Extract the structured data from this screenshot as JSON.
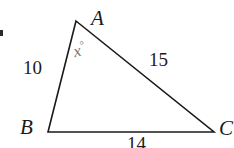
{
  "figure": {
    "background_color": "#ffffff",
    "stroke_color": "#1a1a1a",
    "width": 234,
    "height": 148
  },
  "vertices": {
    "a": {
      "label": "A",
      "x": 76,
      "y": 21
    },
    "b": {
      "label": "B",
      "x": 48,
      "y": 132
    },
    "c": {
      "label": "C",
      "x": 214,
      "y": 132
    }
  },
  "sides": {
    "ab": {
      "label": "10",
      "value": 10
    },
    "ac": {
      "label": "15",
      "value": 15
    },
    "bc": {
      "label": "14",
      "value": 14
    }
  },
  "angle": {
    "at_vertex": "A",
    "variable": "x",
    "degree_symbol": "°",
    "color": "#787878"
  }
}
